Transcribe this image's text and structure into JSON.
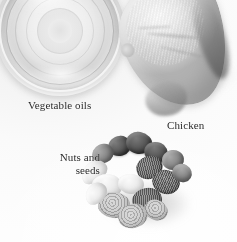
{
  "figure": {
    "width": 237,
    "height": 242,
    "background_color": "#f7f7f7",
    "text_color": "#2a2a2a",
    "is_grayscale": true
  },
  "labels": [
    {
      "id": "vegetable-oils",
      "text": "Vegetable oils",
      "lines": [
        "Vegetable oils"
      ],
      "align": "left",
      "x": 28,
      "y": 99
    },
    {
      "id": "chicken",
      "text": "Chicken",
      "lines": [
        "Chicken"
      ],
      "align": "left",
      "x": 167,
      "y": 119
    },
    {
      "id": "nuts-and-seeds",
      "text": "Nuts and\nseeds",
      "lines": [
        "Nuts and",
        "seeds"
      ],
      "align": "right",
      "x": 38,
      "y": 151
    }
  ],
  "subjects": [
    {
      "id": "vegetable-oils-bowl",
      "name": "glass bowl of vegetable oil",
      "position": "top-left",
      "cropped_at_top": true
    },
    {
      "id": "chicken-breast",
      "name": "raw chicken breast",
      "position": "top-right",
      "cropped_at_top": true
    },
    {
      "id": "nuts-and-seeds-pile",
      "name": "assorted nuts and seeds",
      "position": "bottom-center",
      "items": [
        "almonds",
        "cashews",
        "walnuts",
        "seeds"
      ]
    }
  ]
}
